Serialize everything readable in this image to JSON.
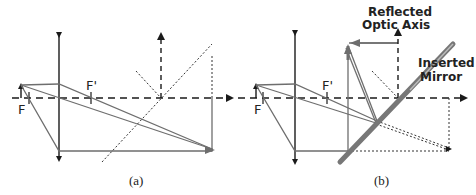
{
  "panels": [
    {
      "id": "a",
      "caption": "(a)",
      "labels": {
        "focal_front": "F",
        "focal_back": "F'"
      }
    },
    {
      "id": "b",
      "caption": "(b)",
      "labels": {
        "focal_front": "F",
        "focal_back": "F'"
      },
      "annotations": {
        "reflected_axis_line1": "Reflected",
        "reflected_axis_line2": "Optic Axis",
        "mirror_line1": "Inserted",
        "mirror_line2": "Mirror"
      }
    }
  ],
  "colors": {
    "ray": "#6e6e6e",
    "axis": "#1a1a1a",
    "mirror": "#777777"
  }
}
